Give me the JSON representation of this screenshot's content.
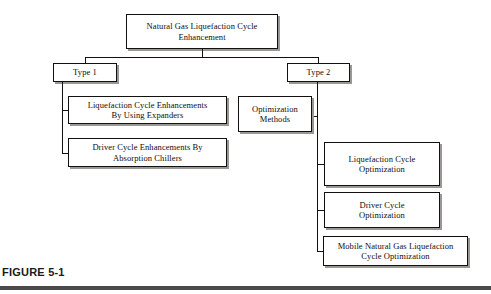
{
  "figure": {
    "caption": "FIGURE 5-1",
    "background_color": "#ffffff",
    "line_color": "#14100f",
    "shadow_color": "#9a9894",
    "rule_color": "#4a4a4a"
  },
  "diagram": {
    "type": "tree",
    "root": {
      "label": "Natural Gas Liquefaction Cycle\nEnhancement"
    },
    "branches": [
      {
        "label": "Type 1",
        "children": [
          {
            "label": "Liquefaction Cycle Enhancements\nBy Using Expanders"
          },
          {
            "label": "Driver Cycle Enhancements By\nAbsorption Chillers"
          }
        ]
      },
      {
        "label": "Type 2",
        "children": [
          {
            "label": "Optimization\nMethods"
          },
          {
            "label": "Liquefaction Cycle\nOptimization"
          },
          {
            "label": "Driver Cycle\nOptimization"
          },
          {
            "label": "Mobile Natural Gas Liquefaction\nCycle Optimization"
          }
        ]
      }
    ]
  }
}
